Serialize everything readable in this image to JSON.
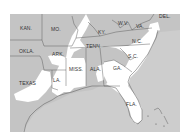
{
  "map": {
    "title": "Southeastern United States",
    "colors": {
      "land_gray": "#c4c4c4",
      "highlight_white": "#ffffff",
      "water": "#cfcfcf",
      "border": "#555555",
      "frame_bg": "#ffffff"
    },
    "states": [
      {
        "id": "kan",
        "label": "KAN."
      },
      {
        "id": "mo",
        "label": "MO."
      },
      {
        "id": "ky",
        "label": "KY."
      },
      {
        "id": "wv",
        "label": "W.V."
      },
      {
        "id": "va",
        "label": "VA."
      },
      {
        "id": "del",
        "label": "DEL."
      },
      {
        "id": "okla",
        "label": "OKLA."
      },
      {
        "id": "ark",
        "label": "ARK."
      },
      {
        "id": "tenn",
        "label": "TENN."
      },
      {
        "id": "nc",
        "label": "N.C."
      },
      {
        "id": "sc",
        "label": "S.C."
      },
      {
        "id": "miss",
        "label": "MISS."
      },
      {
        "id": "ala",
        "label": "ALA."
      },
      {
        "id": "ga",
        "label": "GA."
      },
      {
        "id": "la",
        "label": "LA."
      },
      {
        "id": "texas",
        "label": "TEXAS"
      },
      {
        "id": "fla",
        "label": "FLA."
      }
    ],
    "legend": {
      "gray": "shaded region",
      "white": "highlighted region"
    }
  }
}
